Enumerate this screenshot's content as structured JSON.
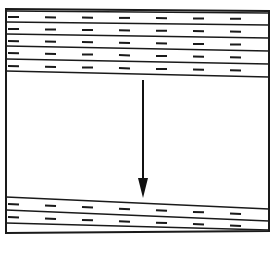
{
  "figure": {
    "kind": "line-diagram",
    "width": 275,
    "height": 257,
    "background_color": "#ffffff",
    "ink_color": "#1a1a1a",
    "caption": ""
  },
  "frame": {
    "name": "outer-box",
    "stroke_color": "#1a1a1a",
    "stroke_width": 2,
    "corners": {
      "top_left": [
        6,
        9
      ],
      "top_right": [
        269,
        11
      ],
      "bottom_right": [
        269,
        231
      ],
      "bottom_left": [
        6,
        233
      ]
    }
  },
  "upper_unit": {
    "label": "upper bedded layers",
    "band_count": 4,
    "fill_color": "#ffffff",
    "line_color": "#1a1a1a",
    "line_width": 1.4,
    "boundaries": [
      {
        "name": "boundary-u0",
        "x1": 6,
        "y1": 11,
        "x2": 269,
        "y2": 13
      },
      {
        "name": "boundary-u1",
        "x1": 6,
        "y1": 22,
        "x2": 269,
        "y2": 25
      },
      {
        "name": "boundary-u2",
        "x1": 6,
        "y1": 34,
        "x2": 269,
        "y2": 38
      },
      {
        "name": "boundary-u3",
        "x1": 6,
        "y1": 46,
        "x2": 269,
        "y2": 51
      },
      {
        "name": "boundary-u4",
        "x1": 6,
        "y1": 59,
        "x2": 269,
        "y2": 64
      },
      {
        "name": "boundary-u5",
        "x1": 6,
        "y1": 71,
        "x2": 269,
        "y2": 77
      }
    ]
  },
  "lower_unit": {
    "label": "lower bedded layers",
    "band_count": 2,
    "fill_color": "#ffffff",
    "line_color": "#1a1a1a",
    "line_width": 1.4,
    "boundaries": [
      {
        "name": "boundary-l0",
        "x1": 6,
        "y1": 197,
        "x2": 269,
        "y2": 209
      },
      {
        "name": "boundary-l1",
        "x1": 6,
        "y1": 210,
        "x2": 269,
        "y2": 221
      },
      {
        "name": "boundary-l2",
        "x1": 6,
        "y1": 223,
        "x2": 269,
        "y2": 230
      }
    ]
  },
  "middle_unit": {
    "label": "unpatterned interval",
    "fill_color": "#ffffff",
    "top_y": 77,
    "bottom_y": 197
  },
  "hatch": {
    "style": "short horizontal dashes",
    "dash_length": 11,
    "dash_gap": 26,
    "dash_thickness": 2,
    "color": "#1a1a1a",
    "rows_upper": [
      {
        "name": "hatch-row-u1",
        "x_start": 8,
        "y_left": 17,
        "y_right": 19,
        "count": 8
      },
      {
        "name": "hatch-row-u2",
        "x_start": 8,
        "y_left": 29,
        "y_right": 32,
        "count": 8
      },
      {
        "name": "hatch-row-u3",
        "x_start": 8,
        "y_left": 41,
        "y_right": 45,
        "count": 8
      },
      {
        "name": "hatch-row-u4",
        "x_start": 8,
        "y_left": 53,
        "y_right": 58,
        "count": 8
      },
      {
        "name": "hatch-row-u5",
        "x_start": 8,
        "y_left": 66,
        "y_right": 71,
        "count": 8
      }
    ],
    "rows_lower": [
      {
        "name": "hatch-row-l1",
        "x_start": 8,
        "y_left": 204,
        "y_right": 215,
        "count": 8
      },
      {
        "name": "hatch-row-l2",
        "x_start": 8,
        "y_left": 217,
        "y_right": 227,
        "count": 8
      }
    ]
  },
  "arrow": {
    "name": "downward-arrow",
    "direction": "down",
    "color": "#111111",
    "shaft": {
      "x": 143,
      "y_top": 80,
      "y_bottom": 180,
      "width": 2
    },
    "head": {
      "tip_x": 143,
      "tip_y": 198,
      "half_width": 5,
      "base_y": 178
    }
  },
  "annotations": []
}
